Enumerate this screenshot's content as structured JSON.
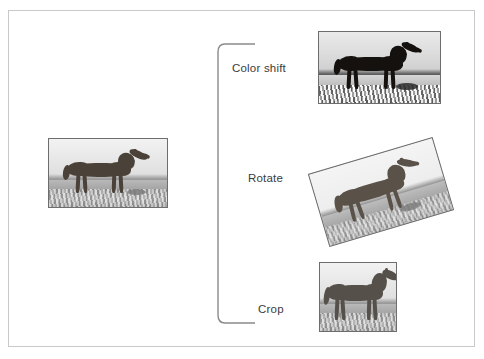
{
  "figure": {
    "background_color": "#ffffff",
    "frame_color": "#c9c9c9"
  },
  "source": {
    "name": "original-image",
    "caption": "",
    "subject": "horse standing in a field",
    "style": "grayscale photograph"
  },
  "bracket": {
    "name": "grouping-bracket",
    "color": "#8a8a8a"
  },
  "augmentations": [
    {
      "id": "color-shift",
      "label": "Color shift",
      "subject": "horse standing in a field",
      "style": "grayscale photograph, darkened high contrast"
    },
    {
      "id": "rotate",
      "label": "Rotate",
      "subject": "horse standing in a field",
      "style": "grayscale photograph, rotated clockwise"
    },
    {
      "id": "crop",
      "label": "Crop",
      "subject": "horse standing in a field",
      "style": "grayscale photograph, cropped close"
    }
  ]
}
